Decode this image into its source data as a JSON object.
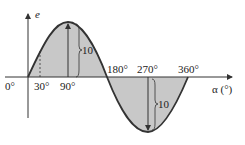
{
  "diagram": {
    "type": "sine waveform",
    "axes": {
      "y_label": "e",
      "x_label": "α (°)"
    },
    "tick_labels": [
      "0°",
      "30°",
      "90°",
      "180°",
      "270°",
      "360°"
    ],
    "amplitude_labels": {
      "positive_peak": "10",
      "negative_peak": "10"
    },
    "colors": {
      "curve": "#333333",
      "fill": "#c8c8c8",
      "axis": "#333333"
    }
  }
}
